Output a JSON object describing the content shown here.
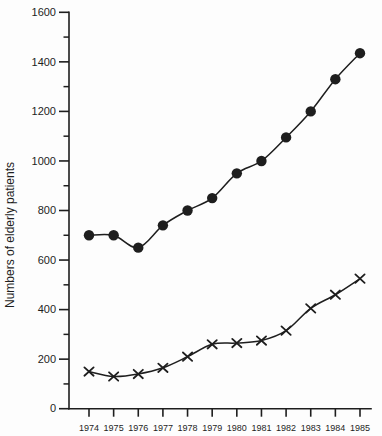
{
  "chart_data": {
    "type": "line",
    "title": "",
    "xlabel": "",
    "ylabel": "Numbers of elderly patients",
    "x": [
      1974,
      1975,
      1976,
      1977,
      1978,
      1979,
      1980,
      1981,
      1982,
      1983,
      1984,
      1985
    ],
    "series": [
      {
        "name": "filled-circle-series",
        "marker": "circle",
        "values": [
          700,
          700,
          650,
          740,
          800,
          850,
          950,
          1000,
          1095,
          1200,
          1330,
          1435
        ]
      },
      {
        "name": "x-marker-series",
        "marker": "x",
        "values": [
          150,
          130,
          140,
          165,
          210,
          260,
          265,
          275,
          315,
          405,
          460,
          525
        ]
      }
    ],
    "ylim": [
      0,
      1600
    ],
    "y_major_ticks": [
      0,
      200,
      400,
      600,
      800,
      1000,
      1200,
      1400,
      1600
    ],
    "y_minor_ticks": [
      100,
      300,
      500,
      700,
      900,
      1100,
      1300,
      1500
    ],
    "grid": false,
    "legend_position": "none",
    "ink_color": "#1e1e1e",
    "background_color": "#fdfdfd"
  }
}
